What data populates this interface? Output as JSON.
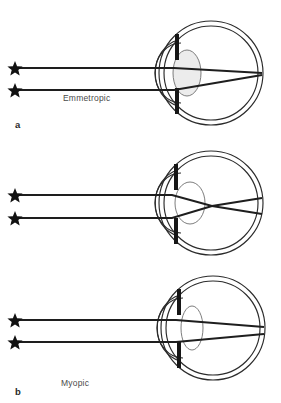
{
  "figure": {
    "background_color": "#ffffff",
    "line_color": "#2b2b2b",
    "ray_color": "#1e1e1e",
    "text_color": "#4a4a4a",
    "lens_fill": "#ececec",
    "iris_color": "#161616"
  },
  "panels": [
    {
      "letter": "a",
      "label": "Emmetropic",
      "focus_description": "rays converge exactly on the retina",
      "lens_shape": "medium",
      "ray_count": 2,
      "source_marker": "star"
    },
    {
      "letter": "b",
      "label": "Myopic",
      "focus_description": "rays converge in front of the retina, then diverge",
      "lens_shape": "thick",
      "ray_count": 2,
      "source_marker": "star"
    },
    {
      "letter": "c",
      "label": "Hyperopic",
      "focus_description": "rays reach the retina before converging; focus lies behind the eye",
      "lens_shape": "thin",
      "ray_count": 2,
      "source_marker": "star"
    }
  ]
}
